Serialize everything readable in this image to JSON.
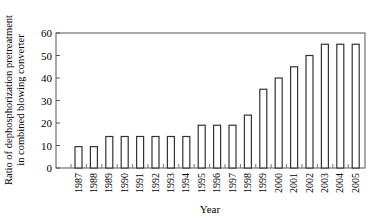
{
  "chart_data": {
    "type": "bar",
    "title": "",
    "xlabel": "Year",
    "ylabel": [
      "Ratio of dephosphorization pretreatment",
      "in combined blowing converter"
    ],
    "ylim": [
      0,
      60
    ],
    "yticks": [
      0,
      10,
      20,
      30,
      40,
      50,
      60
    ],
    "grid": false,
    "legend": null,
    "categories": [
      "1987",
      "1988",
      "1989",
      "1990",
      "1991",
      "1992",
      "1993",
      "1994",
      "1995",
      "1996",
      "1997",
      "1998",
      "1999",
      "2000",
      "2001",
      "2002",
      "2003",
      "2004",
      "2005"
    ],
    "values": [
      9.5,
      9.5,
      14,
      14,
      14,
      14,
      14,
      14,
      19,
      19,
      19,
      23.5,
      35,
      40,
      45,
      50,
      55,
      55,
      55
    ],
    "bar_style": {
      "fill": "#ffffff",
      "stroke": "#333333"
    }
  }
}
